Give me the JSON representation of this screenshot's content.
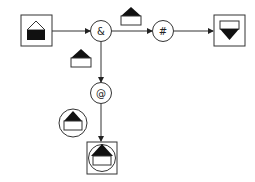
{
  "diagram": {
    "colors": {
      "stroke": "#333333",
      "fill": "#111111",
      "background": "#ffffff"
    },
    "operators": [
      {
        "id": "and",
        "symbol": "&"
      },
      {
        "id": "hash",
        "symbol": "#"
      },
      {
        "id": "at",
        "symbol": "@"
      }
    ],
    "nodes": [
      {
        "id": "input-box",
        "icon": "house-filled-base-icon"
      },
      {
        "id": "output-box-right",
        "icon": "inverted-house-icon"
      },
      {
        "id": "output-box-bottom",
        "icon": "circle-house-icon"
      }
    ],
    "edge_annotations": [
      {
        "between": "and-hash",
        "icon": "house-filled-roof-icon"
      },
      {
        "between": "and-at",
        "icon": "house-filled-roof-icon"
      },
      {
        "between": "at-bottom",
        "icon": "circle-house-icon"
      }
    ]
  }
}
